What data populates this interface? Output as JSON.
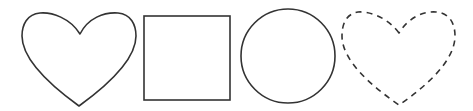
{
  "shapes": [
    {
      "type": "heart",
      "style": "solid",
      "stroke": "#333333"
    },
    {
      "type": "square",
      "style": "solid",
      "stroke": "#333333"
    },
    {
      "type": "circle",
      "style": "solid",
      "stroke": "#333333"
    },
    {
      "type": "heart",
      "style": "dashed",
      "stroke": "#333333"
    }
  ],
  "background": "#ffffff"
}
